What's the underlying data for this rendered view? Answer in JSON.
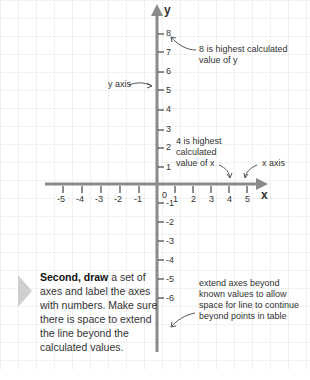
{
  "axes": {
    "x_label": "x",
    "y_label": "y",
    "x_ticks": [
      "-5",
      "-4",
      "-3",
      "-2",
      "-1",
      "1",
      "2",
      "3",
      "4",
      "5"
    ],
    "y_ticks": [
      "8",
      "7",
      "6",
      "5",
      "4",
      "3",
      "2",
      "1",
      "-1",
      "-2",
      "-3",
      "-4",
      "-5",
      "-6"
    ],
    "origin": "0",
    "axis_color": "#8a8a8a"
  },
  "annotations": {
    "y_highest": "8 is highest calculated value of y",
    "y_highest_line1": "8 is highest calculated",
    "y_highest_line2": "value of y",
    "y_axis": "y axis",
    "x_highest_line1": "4 is highest",
    "x_highest_line2": "calculated",
    "x_highest_line3": "value of x",
    "x_axis": "x axis",
    "extend_line1": "extend axes beyond",
    "extend_line2": "known values to allow",
    "extend_line3": "space for line to continue",
    "extend_line4": "beyond points in table"
  },
  "instruction": {
    "bold": "Second, draw",
    "text": " a set of axes and label the axes with numbers. Make sure there is space to extend the line beyond the calculated values."
  }
}
